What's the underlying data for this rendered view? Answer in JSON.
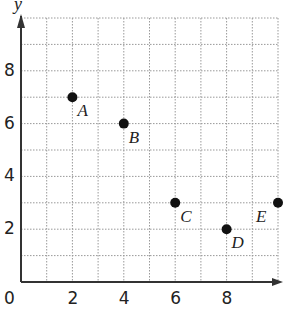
{
  "chart_data": {
    "type": "scatter",
    "title": "",
    "xlabel": "",
    "ylabel": "y",
    "xlim": [
      0,
      10
    ],
    "ylim": [
      0,
      10
    ],
    "grid": true,
    "grid_style": "dotted",
    "x_ticks": [
      {
        "value": 0,
        "label": "0"
      },
      {
        "value": 2,
        "label": "2"
      },
      {
        "value": 4,
        "label": "4"
      },
      {
        "value": 6,
        "label": "6"
      },
      {
        "value": 8,
        "label": "8"
      }
    ],
    "y_ticks": [
      {
        "value": 2,
        "label": "2"
      },
      {
        "value": 4,
        "label": "4"
      },
      {
        "value": 6,
        "label": "6"
      },
      {
        "value": 8,
        "label": "8"
      }
    ],
    "points": [
      {
        "label": "A",
        "x": 2,
        "y": 7
      },
      {
        "label": "B",
        "x": 4,
        "y": 6
      },
      {
        "label": "C",
        "x": 6,
        "y": 3
      },
      {
        "label": "D",
        "x": 8,
        "y": 2
      },
      {
        "label": "E",
        "x": 10,
        "y": 3
      }
    ],
    "colors": {
      "point": "#111111",
      "axis": "#333333",
      "grid": "#999999"
    }
  }
}
